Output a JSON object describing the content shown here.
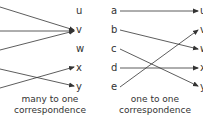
{
  "colors": {
    "line": "#333333",
    "text": "#333333",
    "background": "#ffffff"
  },
  "left_diagram": {
    "targets": [
      "u",
      "v",
      "w",
      "x",
      "y"
    ],
    "caption_line1": "many to one",
    "caption_line2": "correspondence"
  },
  "right_diagram": {
    "sources": [
      "a",
      "b",
      "c",
      "d",
      "e"
    ],
    "targets": [
      "u",
      "v",
      "w",
      "x",
      "y"
    ],
    "caption_line1": "one to one",
    "caption_line2": "correspondence",
    "mappings": [
      {
        "from": "a",
        "to": "u"
      },
      {
        "from": "b",
        "to": "w"
      },
      {
        "from": "c",
        "to": "y"
      },
      {
        "from": "d",
        "to": "x"
      },
      {
        "from": "e",
        "to": "v"
      }
    ]
  }
}
